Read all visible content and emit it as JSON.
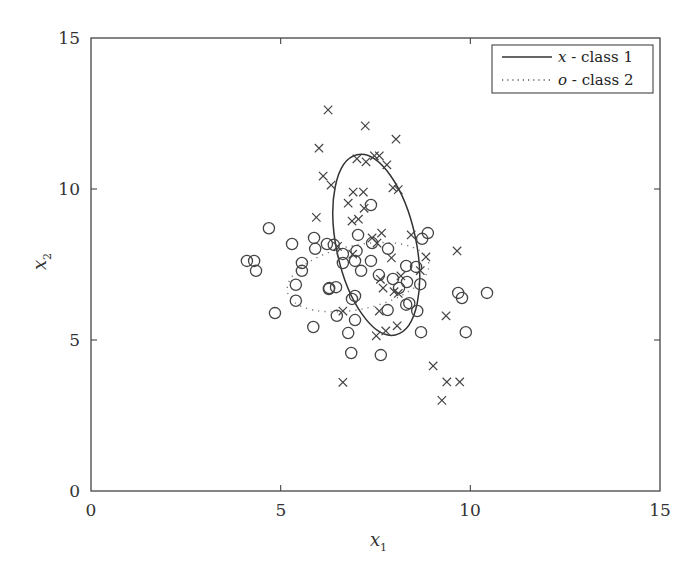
{
  "chart_data": {
    "type": "scatter",
    "title": "",
    "xlabel": "x_1",
    "ylabel": "x_2",
    "xlim": [
      0,
      15
    ],
    "ylim": [
      0,
      15
    ],
    "xticks": [
      0,
      5,
      10,
      15
    ],
    "yticks": [
      0,
      5,
      10,
      15
    ],
    "grid": false,
    "legend_position": "upper right",
    "legend": [
      {
        "symbol": "x",
        "label": "class 1",
        "line_style": "solid"
      },
      {
        "symbol": "o",
        "label": "class 2",
        "line_style": "dotted"
      }
    ],
    "series": [
      {
        "name": "x - class 1",
        "marker": "x",
        "points": [
          [
            6.25,
            12.62
          ],
          [
            7.23,
            12.09
          ],
          [
            6.01,
            11.35
          ],
          [
            8.04,
            11.65
          ],
          [
            6.12,
            10.43
          ],
          [
            6.33,
            10.13
          ],
          [
            7.01,
            11.0
          ],
          [
            7.25,
            10.9
          ],
          [
            7.47,
            11.1
          ],
          [
            7.6,
            11.1
          ],
          [
            7.8,
            10.8
          ],
          [
            7.96,
            10.04
          ],
          [
            8.1,
            9.98
          ],
          [
            5.94,
            9.06
          ],
          [
            7.18,
            9.9
          ],
          [
            6.91,
            9.9
          ],
          [
            6.78,
            9.53
          ],
          [
            7.2,
            9.36
          ],
          [
            7.05,
            9.0
          ],
          [
            6.88,
            8.94
          ],
          [
            7.41,
            8.38
          ],
          [
            7.66,
            8.54
          ],
          [
            8.44,
            8.48
          ],
          [
            7.54,
            8.21
          ],
          [
            7.92,
            7.72
          ],
          [
            8.68,
            7.3
          ],
          [
            6.9,
            7.84
          ],
          [
            9.65,
            7.95
          ],
          [
            7.63,
            7.01
          ],
          [
            8.17,
            7.12
          ],
          [
            7.7,
            6.72
          ],
          [
            8.1,
            6.54
          ],
          [
            7.6,
            5.96
          ],
          [
            8.07,
            5.47
          ],
          [
            7.77,
            5.3
          ],
          [
            7.52,
            5.14
          ],
          [
            9.36,
            5.8
          ],
          [
            6.64,
            5.96
          ],
          [
            6.64,
            3.6
          ],
          [
            9.02,
            4.14
          ],
          [
            9.38,
            3.61
          ],
          [
            9.72,
            3.61
          ],
          [
            9.25,
            3.0
          ],
          [
            6.5,
            8.1
          ],
          [
            8.83,
            7.75
          ],
          [
            7.99,
            6.6
          ]
        ]
      },
      {
        "name": "o - class 2",
        "marker": "o",
        "points": [
          [
            4.69,
            8.7
          ],
          [
            5.3,
            8.18
          ],
          [
            5.88,
            8.38
          ],
          [
            5.91,
            8.02
          ],
          [
            6.22,
            8.18
          ],
          [
            6.4,
            8.15
          ],
          [
            6.64,
            7.85
          ],
          [
            4.11,
            7.62
          ],
          [
            4.3,
            7.62
          ],
          [
            4.35,
            7.29
          ],
          [
            5.56,
            7.55
          ],
          [
            5.56,
            7.29
          ],
          [
            5.4,
            6.83
          ],
          [
            6.27,
            6.69
          ],
          [
            6.46,
            6.75
          ],
          [
            5.4,
            6.3
          ],
          [
            7.38,
            9.47
          ],
          [
            7.04,
            8.48
          ],
          [
            7.41,
            8.21
          ],
          [
            7.83,
            8.02
          ],
          [
            8.73,
            8.35
          ],
          [
            8.88,
            8.54
          ],
          [
            6.64,
            7.55
          ],
          [
            6.96,
            7.62
          ],
          [
            7.12,
            7.29
          ],
          [
            7.38,
            7.62
          ],
          [
            7.59,
            7.15
          ],
          [
            7.96,
            7.02
          ],
          [
            8.12,
            6.72
          ],
          [
            8.31,
            7.45
          ],
          [
            8.57,
            7.42
          ],
          [
            8.33,
            6.92
          ],
          [
            8.68,
            6.85
          ],
          [
            8.39,
            6.22
          ],
          [
            9.68,
            6.56
          ],
          [
            9.78,
            6.39
          ],
          [
            10.44,
            6.56
          ],
          [
            4.85,
            5.89
          ],
          [
            5.86,
            5.43
          ],
          [
            6.48,
            5.8
          ],
          [
            6.88,
            6.36
          ],
          [
            6.96,
            6.46
          ],
          [
            6.96,
            5.66
          ],
          [
            7.82,
            5.99
          ],
          [
            8.31,
            6.17
          ],
          [
            8.6,
            5.96
          ],
          [
            8.7,
            5.26
          ],
          [
            9.88,
            5.26
          ],
          [
            6.78,
            5.23
          ],
          [
            6.86,
            4.57
          ],
          [
            7.64,
            4.5
          ],
          [
            7.0,
            7.95
          ],
          [
            6.28,
            6.72
          ]
        ]
      }
    ],
    "ellipses": [
      {
        "class": "class 1",
        "style": "solid",
        "center": [
          7.52,
          8.15
        ],
        "semi_axes": [
          1.05,
          3.05
        ],
        "rotation_deg": -12
      },
      {
        "class": "class 2",
        "style": "dotted",
        "center": [
          7.04,
          7.08
        ],
        "semi_axes": [
          1.9,
          1.06
        ],
        "rotation_deg": -12
      }
    ]
  },
  "axes": {
    "xlabel_main": "x",
    "xlabel_sub": "1",
    "ylabel_main": "x",
    "ylabel_sub": "2",
    "xtick_labels": [
      "0",
      "5",
      "10",
      "15"
    ],
    "ytick_labels": [
      "0",
      "5",
      "10",
      "15"
    ]
  },
  "legend": {
    "entry1_symbol": "x",
    "entry1_text": " - class 1",
    "entry2_symbol": "o",
    "entry2_text": " - class 2"
  }
}
